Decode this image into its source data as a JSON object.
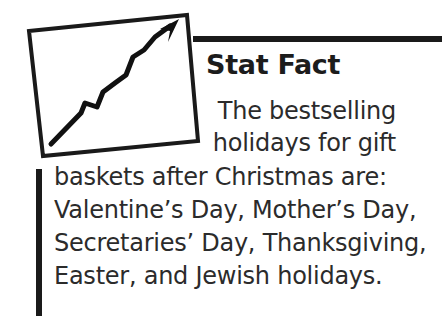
{
  "callout": {
    "type": "stat-fact-sidebar",
    "heading": "Stat Fact",
    "icon": {
      "name": "rising-chart-arrow-icon",
      "description": "tilted rectangle frame containing an upward zigzag trend arrow"
    },
    "body_lines": [
      "The bestselling",
      "holidays for gift",
      "baskets after Christmas are:",
      "Valentine’s Day, Mother’s Day,",
      "Secretaries’ Day, Thanksgiving,",
      "Easter, and Jewish holidays."
    ],
    "body_text": "The bestselling holidays for gift baskets after Christmas are: Valentine’s Day, Mother’s Day, Secretaries’ Day, Thanksgiving, Easter, and Jewish holidays.",
    "colors": {
      "rule": "#1a1a1a",
      "heading_text": "#1c1c1c",
      "body_text": "#2b2b2b",
      "background": "#ffffff"
    }
  }
}
